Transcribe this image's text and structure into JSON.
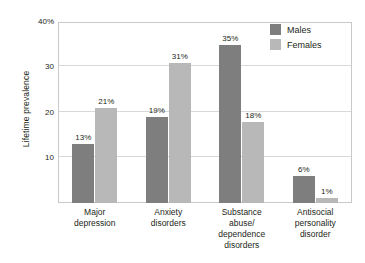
{
  "chart_data": {
    "type": "bar",
    "title": "",
    "xlabel": "",
    "ylabel": "Lifetime prevalence",
    "ylim": [
      0,
      40
    ],
    "yticks": [
      10,
      20,
      30,
      40
    ],
    "ytick_labels": [
      "10",
      "20",
      "30",
      "40%"
    ],
    "grid": true,
    "legend_position": "top-right",
    "value_suffix": "%",
    "categories": [
      "Major\ndepression",
      "Anxiety\ndisorders",
      "Substance\nabuse/\ndependence\ndisorders",
      "Antisocial\npersonality\ndisorder"
    ],
    "category_lines": [
      [
        "Major",
        "depression"
      ],
      [
        "Anxiety",
        "disorders"
      ],
      [
        "Substance",
        "abuse/",
        "dependence",
        "disorders"
      ],
      [
        "Antisocial",
        "personality",
        "disorder"
      ]
    ],
    "series": [
      {
        "name": "Males",
        "color": "#7e7e7e",
        "values": [
          13,
          19,
          35,
          6
        ],
        "labels": [
          "13%",
          "19%",
          "35%",
          "6%"
        ]
      },
      {
        "name": "Females",
        "color": "#b8b8b8",
        "values": [
          21,
          31,
          18,
          1
        ],
        "labels": [
          "21%",
          "31%",
          "18%",
          "1%"
        ]
      }
    ]
  },
  "legend": {
    "items": [
      {
        "label": "Males",
        "color": "#7e7e7e"
      },
      {
        "label": "Females",
        "color": "#b8b8b8"
      }
    ]
  },
  "axis": {
    "y_title": "Lifetime prevalence",
    "y_tick_labels": [
      "40%",
      "30",
      "20",
      "10"
    ]
  }
}
